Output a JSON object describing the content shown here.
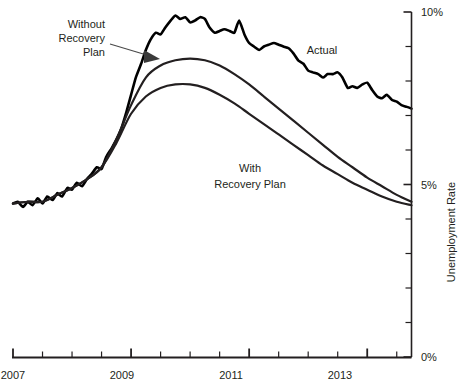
{
  "chart_data": {
    "type": "line",
    "title": "",
    "xlabel": "",
    "ylabel": "Unemployment Rate",
    "xlim": [
      2007.0,
      2013.75
    ],
    "ylim": [
      0,
      10
    ],
    "grid": false,
    "legend": "inline-annotations",
    "x_ticks_major": [
      "2007",
      "2009",
      "2011",
      "2013"
    ],
    "x_tick_values_major": [
      2007,
      2009,
      2011,
      2013
    ],
    "x_minor_tick_step": 0.5,
    "y_ticks_major": [
      "0%",
      "5%",
      "10%"
    ],
    "y_tick_values_major": [
      0,
      5,
      10
    ],
    "y_minor_tick_step": 1,
    "annotations": [
      {
        "name": "without-recovery-plan-label",
        "text_lines": [
          "Without",
          "Recovery",
          "Plan"
        ],
        "target_series": "Without Recovery Plan",
        "has_arrow": true
      },
      {
        "name": "with-recovery-plan-label",
        "text_lines": [
          "With",
          "Recovery Plan"
        ],
        "target_series": "With Recovery Plan",
        "has_arrow": false
      },
      {
        "name": "actual-label",
        "text_lines": [
          "Actual"
        ],
        "target_series": "Actual",
        "has_arrow": false
      }
    ],
    "series": [
      {
        "name": "Actual",
        "color": "#000000",
        "width": 2.6,
        "points": [
          [
            2007.0,
            4.45
          ],
          [
            2007.08,
            4.5
          ],
          [
            2007.17,
            4.35
          ],
          [
            2007.25,
            4.5
          ],
          [
            2007.33,
            4.4
          ],
          [
            2007.42,
            4.6
          ],
          [
            2007.5,
            4.45
          ],
          [
            2007.58,
            4.65
          ],
          [
            2007.67,
            4.55
          ],
          [
            2007.75,
            4.75
          ],
          [
            2007.83,
            4.65
          ],
          [
            2007.92,
            4.9
          ],
          [
            2008.0,
            4.85
          ],
          [
            2008.08,
            5.05
          ],
          [
            2008.17,
            4.95
          ],
          [
            2008.25,
            5.15
          ],
          [
            2008.33,
            5.3
          ],
          [
            2008.42,
            5.5
          ],
          [
            2008.5,
            5.45
          ],
          [
            2008.58,
            5.8
          ],
          [
            2008.67,
            6.05
          ],
          [
            2008.75,
            6.3
          ],
          [
            2008.83,
            6.6
          ],
          [
            2008.92,
            7.1
          ],
          [
            2009.0,
            7.6
          ],
          [
            2009.08,
            8.1
          ],
          [
            2009.17,
            8.5
          ],
          [
            2009.25,
            8.9
          ],
          [
            2009.33,
            9.2
          ],
          [
            2009.42,
            9.4
          ],
          [
            2009.5,
            9.35
          ],
          [
            2009.58,
            9.55
          ],
          [
            2009.67,
            9.75
          ],
          [
            2009.75,
            9.9
          ],
          [
            2009.83,
            9.8
          ],
          [
            2009.92,
            9.85
          ],
          [
            2010.0,
            9.7
          ],
          [
            2010.08,
            9.75
          ],
          [
            2010.17,
            9.85
          ],
          [
            2010.25,
            9.8
          ],
          [
            2010.33,
            9.55
          ],
          [
            2010.42,
            9.4
          ],
          [
            2010.5,
            9.45
          ],
          [
            2010.58,
            9.5
          ],
          [
            2010.67,
            9.45
          ],
          [
            2010.75,
            9.4
          ],
          [
            2010.83,
            9.75
          ],
          [
            2010.92,
            9.35
          ],
          [
            2011.0,
            9.1
          ],
          [
            2011.08,
            9.0
          ],
          [
            2011.17,
            8.9
          ],
          [
            2011.25,
            9.0
          ],
          [
            2011.33,
            9.05
          ],
          [
            2011.42,
            9.1
          ],
          [
            2011.5,
            9.05
          ],
          [
            2011.58,
            9.0
          ],
          [
            2011.67,
            8.95
          ],
          [
            2011.75,
            8.8
          ],
          [
            2011.83,
            8.6
          ],
          [
            2011.92,
            8.5
          ],
          [
            2012.0,
            8.3
          ],
          [
            2012.08,
            8.25
          ],
          [
            2012.17,
            8.2
          ],
          [
            2012.25,
            8.1
          ],
          [
            2012.33,
            8.2
          ],
          [
            2012.42,
            8.2
          ],
          [
            2012.5,
            8.25
          ],
          [
            2012.58,
            8.1
          ],
          [
            2012.67,
            7.8
          ],
          [
            2012.75,
            7.85
          ],
          [
            2012.83,
            7.8
          ],
          [
            2012.92,
            7.9
          ],
          [
            2013.0,
            7.95
          ],
          [
            2013.08,
            7.75
          ],
          [
            2013.17,
            7.55
          ],
          [
            2013.25,
            7.5
          ],
          [
            2013.33,
            7.6
          ],
          [
            2013.42,
            7.45
          ],
          [
            2013.5,
            7.4
          ],
          [
            2013.58,
            7.3
          ],
          [
            2013.67,
            7.25
          ],
          [
            2013.75,
            7.2
          ]
        ]
      },
      {
        "name": "Without Recovery Plan",
        "color": "#231f20",
        "width": 2.2,
        "points": [
          [
            2007.0,
            4.45
          ],
          [
            2007.25,
            4.5
          ],
          [
            2007.5,
            4.5
          ],
          [
            2007.75,
            4.7
          ],
          [
            2008.0,
            4.9
          ],
          [
            2008.25,
            5.15
          ],
          [
            2008.5,
            5.5
          ],
          [
            2008.75,
            6.3
          ],
          [
            2009.0,
            7.3
          ],
          [
            2009.25,
            8.1
          ],
          [
            2009.5,
            8.45
          ],
          [
            2009.75,
            8.6
          ],
          [
            2010.0,
            8.65
          ],
          [
            2010.25,
            8.6
          ],
          [
            2010.5,
            8.45
          ],
          [
            2010.75,
            8.2
          ],
          [
            2011.0,
            7.9
          ],
          [
            2011.25,
            7.55
          ],
          [
            2011.5,
            7.2
          ],
          [
            2011.75,
            6.85
          ],
          [
            2012.0,
            6.5
          ],
          [
            2012.25,
            6.15
          ],
          [
            2012.5,
            5.8
          ],
          [
            2012.75,
            5.5
          ],
          [
            2013.0,
            5.2
          ],
          [
            2013.25,
            4.95
          ],
          [
            2013.5,
            4.7
          ],
          [
            2013.75,
            4.5
          ]
        ]
      },
      {
        "name": "With Recovery Plan",
        "color": "#231f20",
        "width": 2.2,
        "points": [
          [
            2007.0,
            4.45
          ],
          [
            2007.25,
            4.5
          ],
          [
            2007.5,
            4.5
          ],
          [
            2007.75,
            4.7
          ],
          [
            2008.0,
            4.9
          ],
          [
            2008.25,
            5.15
          ],
          [
            2008.5,
            5.5
          ],
          [
            2008.75,
            6.2
          ],
          [
            2009.0,
            7.05
          ],
          [
            2009.25,
            7.55
          ],
          [
            2009.5,
            7.8
          ],
          [
            2009.75,
            7.9
          ],
          [
            2010.0,
            7.9
          ],
          [
            2010.25,
            7.8
          ],
          [
            2010.5,
            7.6
          ],
          [
            2010.75,
            7.35
          ],
          [
            2011.0,
            7.05
          ],
          [
            2011.25,
            6.75
          ],
          [
            2011.5,
            6.45
          ],
          [
            2011.75,
            6.15
          ],
          [
            2012.0,
            5.85
          ],
          [
            2012.25,
            5.55
          ],
          [
            2012.5,
            5.3
          ],
          [
            2012.75,
            5.05
          ],
          [
            2013.0,
            4.85
          ],
          [
            2013.25,
            4.65
          ],
          [
            2013.5,
            4.5
          ],
          [
            2013.75,
            4.4
          ]
        ]
      }
    ]
  },
  "labels": {
    "without_line1": "Without",
    "without_line2": "Recovery",
    "without_line3": "Plan",
    "with_line1": "With",
    "with_line2": "Recovery Plan",
    "actual": "Actual",
    "y_axis_title": "Unemployment Rate",
    "y_top": "10%",
    "y_mid": "5%",
    "y_bottom": "0%",
    "x_2007": "2007",
    "x_2009": "2009",
    "x_2011": "2011",
    "x_2013": "2013"
  }
}
